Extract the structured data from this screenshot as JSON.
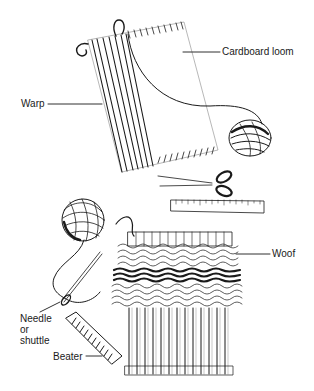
{
  "diagram": {
    "type": "labeled-illustration",
    "ink_color": "#1a1a1a",
    "background": "#ffffff",
    "labels": {
      "cardboard_loom": "Cardboard loom",
      "warp": "Warp",
      "woof": "Woof",
      "needle_line1": "Needle",
      "needle_line2": "or",
      "needle_line3": "shuttle",
      "beater": "Beater"
    },
    "objects": [
      "cardboard-loom",
      "warp-threads",
      "ball-of-yarn",
      "scissors",
      "ruler",
      "second-ball-of-yarn",
      "weaving-in-progress",
      "needle",
      "beater-comb"
    ]
  }
}
